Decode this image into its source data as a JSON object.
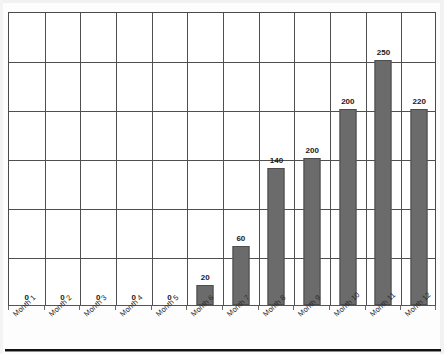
{
  "chart_data": {
    "type": "bar",
    "title": "",
    "subtitle": "",
    "xlabel": "",
    "ylabel": "",
    "categories": [
      "Month 1",
      "Month 2",
      "Month 3",
      "Month 4",
      "Month 5",
      "Month 6",
      "Month 7",
      "Month 8",
      "Month 9",
      "Month 10",
      "Month 11",
      "Month 12"
    ],
    "values": [
      0,
      0,
      0,
      0,
      0,
      20,
      60,
      140,
      200,
      200,
      250,
      220
    ],
    "data_labels": [
      "0",
      "0",
      "0",
      "0",
      "0",
      "20",
      "60",
      "140",
      "200",
      "200",
      "250",
      "220"
    ],
    "plotted_heights": [
      0,
      0,
      0,
      0,
      0,
      20,
      60,
      140,
      150,
      200,
      250,
      200
    ],
    "ylim": [
      0,
      300
    ],
    "y_gridline_values": [
      0,
      50,
      100,
      150,
      200,
      250,
      300
    ],
    "y_tick_labels_visible": false,
    "grid": true,
    "grid_vertical": true,
    "grid_horizontal": true,
    "legend": false,
    "legend_position": "none",
    "bar_color": "#6b6b6b",
    "bar_border_color": "#4d4d4d",
    "grid_color": "#4f4f4f",
    "axis_color": "#4a4a4a",
    "label_color": "#1a1a1a",
    "tick_label_color": "#2b2b2b",
    "x_tick_label_rotation": -43
  }
}
